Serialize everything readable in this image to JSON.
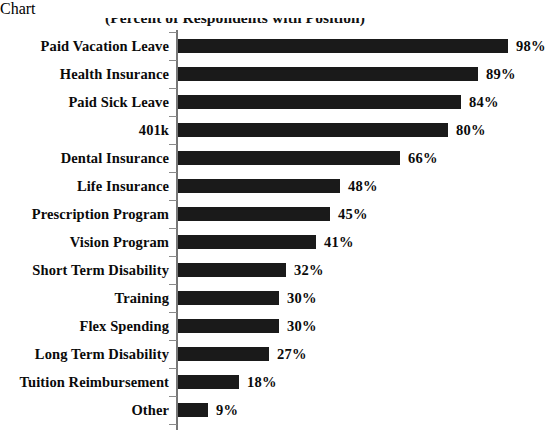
{
  "chart_data": {
    "type": "bar",
    "orientation": "horizontal",
    "title": "(Percent of Respondents with Position)",
    "xlabel": "",
    "ylabel": "",
    "xlim": [
      0,
      100
    ],
    "grid": false,
    "legend": false,
    "value_suffix": "%",
    "bar_color": "#1a1a1a",
    "axis_color": "#777777",
    "text_color": "#0a0a0a",
    "background_color": "#ffffff",
    "categories": [
      "Paid Vacation Leave",
      "Health Insurance",
      "Paid Sick Leave",
      "401k",
      "Dental Insurance",
      "Life Insurance",
      "Prescription Program",
      "Vision Program",
      "Short Term Disability",
      "Training",
      "Flex Spending",
      "Long Term Disability",
      "Tuition Reimbursement",
      "Other"
    ],
    "values": [
      98,
      89,
      84,
      80,
      66,
      48,
      45,
      41,
      32,
      30,
      30,
      27,
      18,
      9
    ],
    "value_labels": [
      "98%",
      "89%",
      "84%",
      "80%",
      "66%",
      "48%",
      "45%",
      "41%",
      "32%",
      "30%",
      "30%",
      "27%",
      "18%",
      "9%"
    ]
  }
}
